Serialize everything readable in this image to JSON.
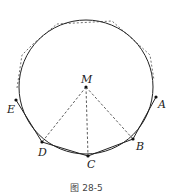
{
  "figure": {
    "caption": "图 28-5",
    "circle": {
      "cx": 86,
      "cy": 87,
      "r": 67
    },
    "center": {
      "label": "M",
      "x": 86,
      "y": 87
    },
    "points": [
      {
        "label": "A",
        "x": 156,
        "y": 97,
        "lx": 160,
        "ly": 108
      },
      {
        "label": "B",
        "x": 133,
        "y": 139,
        "lx": 137,
        "ly": 151
      },
      {
        "label": "C",
        "x": 88,
        "y": 156,
        "lx": 86,
        "ly": 170
      },
      {
        "label": "D",
        "x": 42,
        "y": 142,
        "lx": 38,
        "ly": 156
      },
      {
        "label": "E",
        "x": 16,
        "y": 100,
        "lx": 7,
        "ly": 112
      }
    ],
    "dashed_radii": [
      "D",
      "C",
      "B"
    ],
    "colors": {
      "stroke": "#222222",
      "dash": "#333333"
    }
  }
}
